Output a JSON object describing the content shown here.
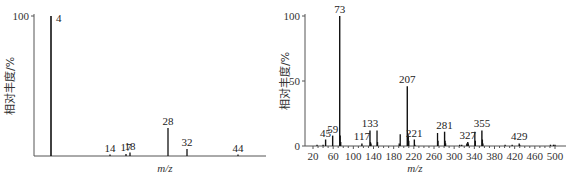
{
  "chart_data": [
    {
      "type": "bar",
      "subtype": "mass-spectrum-stick",
      "title": "",
      "xlabel": "m/z",
      "ylabel": "相对丰度/%",
      "ylim": [
        0,
        100
      ],
      "yticks": [
        100
      ],
      "xticks": [],
      "grid": false,
      "x": [
        4,
        14,
        17,
        18,
        28,
        32,
        44
      ],
      "values": [
        100,
        1,
        1.5,
        2.5,
        20,
        5,
        1
      ],
      "peak_labels": [
        "4",
        "14",
        "17",
        "18",
        "28",
        "32",
        "44"
      ]
    },
    {
      "type": "bar",
      "subtype": "mass-spectrum-stick",
      "title": "",
      "xlabel": "m/z",
      "ylabel": "相对丰度/%",
      "ylim": [
        0,
        100
      ],
      "yticks": [
        0,
        50,
        100
      ],
      "xticks": [
        20,
        60,
        100,
        140,
        180,
        220,
        260,
        300,
        340,
        380,
        420,
        460,
        500
      ],
      "xlim": [
        20,
        505
      ],
      "grid": false,
      "labeled_peaks": {
        "x": [
          45,
          59,
          73,
          117,
          133,
          207,
          221,
          281,
          327,
          355,
          429
        ],
        "values": [
          5,
          8,
          100,
          2,
          12,
          46,
          5,
          11,
          3,
          12,
          2
        ]
      },
      "other_peaks": {
        "x": [
          28,
          40,
          74,
          75,
          134,
          135,
          147,
          148,
          191,
          193,
          208,
          209,
          210,
          222,
          267,
          268,
          282,
          283,
          311,
          315,
          325,
          328,
          341,
          342,
          356,
          357,
          401,
          415,
          430,
          491,
          497,
          500
        ],
        "values": [
          1,
          1,
          8,
          3,
          3,
          2,
          12,
          3,
          2,
          9,
          10,
          8,
          4,
          1,
          10,
          4,
          4,
          2,
          1,
          1,
          2,
          2,
          11,
          4,
          5,
          2,
          1,
          1,
          1,
          1,
          1,
          1
        ]
      }
    }
  ],
  "left_chart": {
    "ylabel": "相对丰度/%",
    "xlabel": "m/z",
    "ytick_100": "100"
  },
  "right_chart": {
    "ylabel": "相对丰度/%",
    "xlabel": "m/z",
    "yticks": [
      "0",
      "50",
      "100"
    ],
    "xticks": [
      "20",
      "60",
      "100",
      "140",
      "180",
      "220",
      "260",
      "300",
      "340",
      "380",
      "420",
      "460",
      "500"
    ]
  }
}
